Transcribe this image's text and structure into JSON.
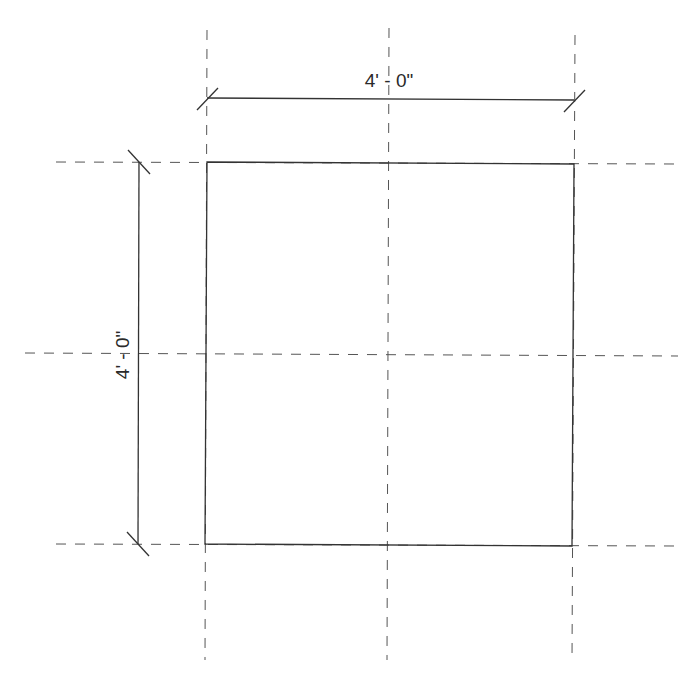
{
  "drawing": {
    "type": "plan grid with dimensions",
    "line_color": "#3a3a3a",
    "dash_color": "#555555",
    "dimensions": {
      "horizontal": {
        "label": "4' - 0\""
      },
      "vertical": {
        "label": "4' - 0\""
      }
    },
    "grid": {
      "vertical_lines": 3,
      "horizontal_lines": 3
    }
  }
}
